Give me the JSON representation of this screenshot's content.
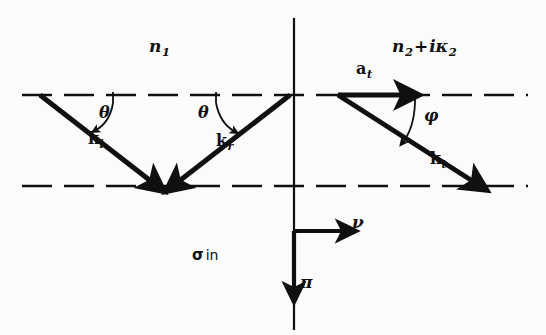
{
  "figure": {
    "background_color": "#fbfbfb",
    "ink_color": "#101010"
  },
  "media": {
    "incident_medium": {
      "label": "n",
      "subscript": "1",
      "full": "n1"
    },
    "transmitting_medium": {
      "n_symbol": "n",
      "n_subscript": "2",
      "operator": "+",
      "i_symbol": "i",
      "kappa_symbol": "κ",
      "kappa_subscript": "2",
      "full": "n2+iκ2"
    }
  },
  "rays": [
    {
      "name": "incident-ray",
      "label_symbol": "k",
      "label_subscript": "i",
      "label_x": 88,
      "label_y": 138,
      "x1": 40,
      "y1": 95,
      "x2": 158,
      "y2": 187
    },
    {
      "name": "reflected-ray",
      "label_symbol": "k",
      "label_subscript": "r",
      "label_x": 216,
      "label_y": 140,
      "x1": 290,
      "y1": 95,
      "x2": 172,
      "y2": 187
    },
    {
      "name": "transmitted-ray",
      "label_symbol": "k",
      "label_subscript": "t",
      "label_x": 432,
      "label_y": 158,
      "x1": 338,
      "y1": 95,
      "x2": 480,
      "y2": 186
    }
  ],
  "amplitude_vector": {
    "name": "transmitted-amplitude-vector",
    "label_symbol": "a",
    "label_subscript": "t",
    "label_x": 358,
    "label_y": 68,
    "x1": 338,
    "y1": 95,
    "x2": 412,
    "y2": 95
  },
  "angles": [
    {
      "name": "incidence-angle",
      "symbol": "θ",
      "x": 100,
      "y": 110
    },
    {
      "name": "reflection-angle",
      "symbol": "θ",
      "x": 220,
      "y": 110
    },
    {
      "name": "refraction-angle",
      "symbol": "φ",
      "x": 428,
      "y": 113
    }
  ],
  "polarization_note": {
    "symbol": "σ",
    "word": "in",
    "x": 192,
    "y": 247
  },
  "axes": {
    "vertical_normal": {
      "name": "interface-normal",
      "x": 294,
      "y_top": 18,
      "y_bottom": 330
    },
    "nu_axis": {
      "label": "ν",
      "label_x": 356,
      "label_y": 221,
      "x1": 294,
      "y1": 231,
      "x2": 352,
      "y2": 231
    },
    "pi_axis": {
      "label": "π",
      "label_x": 300,
      "label_y": 281,
      "x1": 294,
      "y1": 231,
      "x2": 294,
      "y2": 299
    }
  },
  "interface_lines": [
    {
      "name": "upper-boundary-dashed-line",
      "y": 95,
      "x_start": 22,
      "x_end": 528
    },
    {
      "name": "lower-boundary-dashed-line",
      "y": 186,
      "x_start": 22,
      "x_end": 528
    }
  ]
}
